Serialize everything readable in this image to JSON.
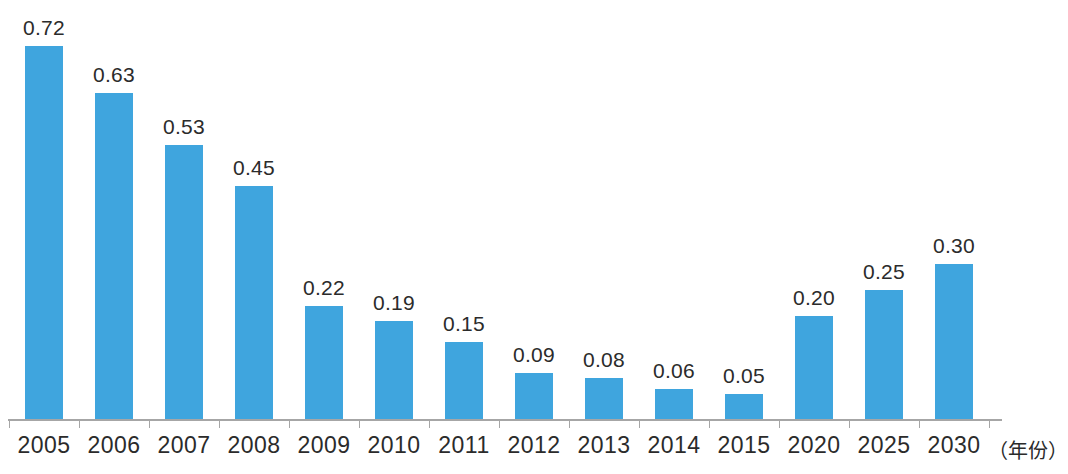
{
  "chart_data": {
    "type": "bar",
    "title": "",
    "subtitle": "",
    "xlabel": "（年份）",
    "ylabel": "",
    "categories": [
      "2005",
      "2006",
      "2007",
      "2008",
      "2009",
      "2010",
      "2011",
      "2012",
      "2013",
      "2014",
      "2015",
      "2020",
      "2025",
      "2030"
    ],
    "values": [
      0.72,
      0.63,
      0.53,
      0.45,
      0.22,
      0.19,
      0.15,
      0.09,
      0.08,
      0.06,
      0.05,
      0.2,
      0.25,
      0.3
    ],
    "value_labels": [
      "0.72",
      "0.63",
      "0.53",
      "0.45",
      "0.22",
      "0.19",
      "0.15",
      "0.09",
      "0.08",
      "0.06",
      "0.05",
      "0.20",
      "0.25",
      "0.30"
    ],
    "ylim": [
      0,
      0.72
    ],
    "grid": false,
    "legend": null,
    "bar_color": "#3fa5de",
    "axis_color": "#a6a6a6",
    "text_color": "#2b2b2b",
    "background_color": "#ffffff",
    "data_labels_shown": true,
    "y_axis_shown": false,
    "tick_marks": true
  }
}
